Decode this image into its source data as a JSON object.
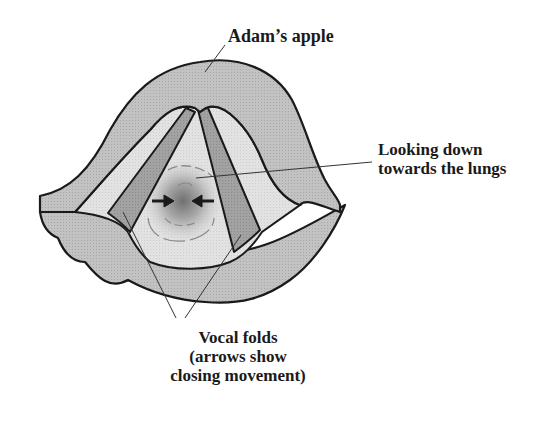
{
  "figure": {
    "type": "anatomical-diagram"
  },
  "labels": {
    "adams_apple": "Adam’s apple",
    "looking_down": {
      "line1": "Looking down",
      "line2": "towards the lungs"
    },
    "vocal_folds": {
      "line1": "Vocal folds",
      "line2": "(arrows show",
      "line3": "closing movement)"
    }
  },
  "colors": {
    "outline": "#1a1a1a",
    "tissue_mid": "#bdbdbd",
    "tissue_light": "#dcdcdc",
    "vocal_fold_band": "#9e9e9e",
    "airway_center": "#7a7a7a",
    "background": "#ffffff"
  },
  "annotations": {
    "arrows": "two horizontal arrows pointing toward center (closing movement)"
  }
}
